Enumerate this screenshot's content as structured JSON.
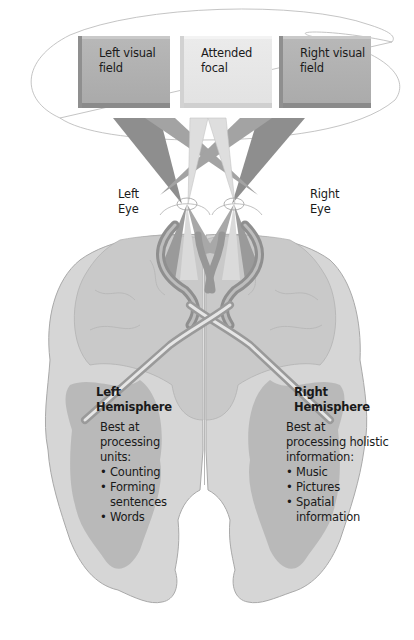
{
  "visual_fields": [
    {
      "label": "Left visual field",
      "line1": "Left visual",
      "line2": "field",
      "color": "#ababab"
    },
    {
      "label": "Attended focal",
      "line1": "Attended",
      "line2": "focal",
      "color": "#e6e6e6"
    },
    {
      "label": "Right visual field",
      "line1": "Right visual",
      "line2": "field",
      "color": "#ababab"
    }
  ],
  "eyes": {
    "left": {
      "line1": "Left",
      "line2": "Eye"
    },
    "right": {
      "line1": "Right",
      "line2": "Eye"
    }
  },
  "hemispheres": {
    "left": {
      "title_line1": "Left",
      "title_line2": "Hemisphere",
      "desc_line1": "Best at",
      "desc_line2": "processing",
      "desc_line3": "units:",
      "items": [
        "Counting",
        "Forming",
        "sentences",
        "Words"
      ]
    },
    "right": {
      "title_line1": "Right",
      "title_line2": "Hemisphere",
      "desc_line1": "Best at",
      "desc_line2": "processing holistic",
      "desc_line3": "information:",
      "items": [
        "Music",
        "Pictures",
        "Spatial",
        "information"
      ]
    }
  },
  "colors": {
    "brain_light": "#d9d9d9",
    "brain_mid": "#c8c8c8",
    "white_matter_dark": "#a8a8a8",
    "ray_dark": "#8c8c8c",
    "ray_mid": "#a3a3a3",
    "ray_light": "#dcdcdc",
    "outline": "#9a9a9a"
  }
}
